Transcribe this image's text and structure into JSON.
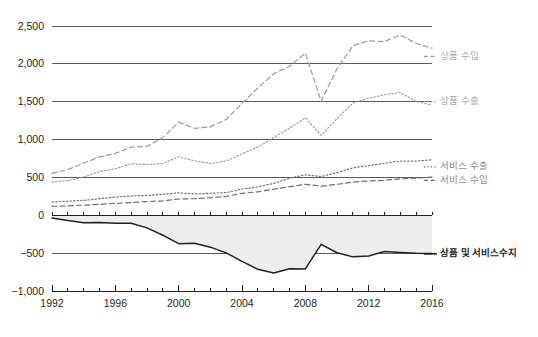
{
  "chart_data": {
    "type": "line",
    "title": "",
    "subtitle": "",
    "xlabel": "",
    "ylabel": "",
    "xlim": [
      1992,
      2016
    ],
    "ylim": [
      -1000,
      2500
    ],
    "grid": true,
    "grid_axis": "y",
    "legend_position": "right-inline",
    "x": [
      1992,
      1993,
      1994,
      1995,
      1996,
      1997,
      1998,
      1999,
      2000,
      2001,
      2002,
      2003,
      2004,
      2005,
      2006,
      2007,
      2008,
      2009,
      2010,
      2011,
      2012,
      2013,
      2014,
      2015,
      2016
    ],
    "ytick_labels": [
      "2,500",
      "2,000",
      "1,500",
      "1,000",
      "500",
      "0",
      "−500",
      "−1,000"
    ],
    "ytick_values": [
      2500,
      2000,
      1500,
      1000,
      500,
      0,
      -500,
      -1000
    ],
    "xtick_labels": [
      "1992",
      "1996",
      "2000",
      "2004",
      "2008",
      "2012",
      "2016"
    ],
    "xtick_values": [
      1992,
      1996,
      2000,
      2004,
      2008,
      2012,
      2016
    ],
    "series": [
      {
        "name": "상품 수입",
        "style": "dashed",
        "color": "#9a9a9a",
        "label_color": "#aaaaaa",
        "label_y_value": 2100,
        "values": [
          554,
          603,
          689,
          771,
          817,
          899,
          911,
          1025,
          1230,
          1148,
          1168,
          1265,
          1478,
          1682,
          1868,
          1968,
          2141,
          1506,
          1935,
          2240,
          2304,
          2295,
          2381,
          2269,
          2208
        ]
      },
      {
        "name": "상품 수출",
        "style": "dotted",
        "color": "#9a9a9a",
        "label_color": "#aaaaaa",
        "label_y_value": 1500,
        "values": [
          440,
          459,
          505,
          577,
          614,
          680,
          670,
          684,
          772,
          719,
          685,
          717,
          811,
          901,
          1026,
          1148,
          1287,
          1056,
          1278,
          1482,
          1546,
          1592,
          1621,
          1503,
          1456
        ]
      },
      {
        "name": "서비스 수출",
        "style": "dotted",
        "color": "#6f6f6f",
        "label_color": "#8e8e8e",
        "label_y_value": 640,
        "values": [
          177,
          186,
          197,
          219,
          240,
          256,
          262,
          277,
          297,
          281,
          291,
          299,
          344,
          377,
          421,
          489,
          534,
          512,
          563,
          627,
          655,
          688,
          717,
          716,
          733
        ]
      },
      {
        "name": "서비스 수입",
        "style": "dashed",
        "color": "#6f6f6f",
        "label_color": "#8e8e8e",
        "label_y_value": 460,
        "values": [
          117,
          124,
          134,
          144,
          157,
          168,
          180,
          191,
          215,
          219,
          232,
          250,
          290,
          310,
          345,
          378,
          409,
          385,
          409,
          438,
          453,
          462,
          481,
          492,
          505
        ]
      },
      {
        "name": "상품 및 서비스수지",
        "style": "solid",
        "color": "#231f20",
        "label_color": "#231f20",
        "label_y_value": -510,
        "fill_to_zero": true,
        "fill_color": "#ededed",
        "values": [
          -35,
          -70,
          -98,
          -96,
          -104,
          -105,
          -166,
          -263,
          -375,
          -368,
          -421,
          -496,
          -608,
          -714,
          -762,
          -705,
          -709,
          -384,
          -495,
          -549,
          -537,
          -478,
          -490,
          -500,
          -504
        ]
      }
    ]
  },
  "axes": {
    "x_minor_ticks": "every year",
    "zero_line": "0"
  }
}
